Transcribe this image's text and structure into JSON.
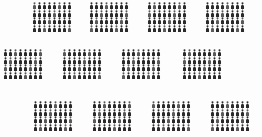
{
  "canvas": {
    "width": 262,
    "height": 137,
    "background": "#fdfdfd",
    "description": "Pictogram infographic of twelve blocks of small person-shaped figure icons"
  },
  "figure": {
    "icon_name": "person-figure-icon",
    "color": "#2b2b2b",
    "color_light": "#5a5a5a",
    "cell_width": 5,
    "cell_height": 7.6,
    "glyph_width": 3.4,
    "glyph_height": 6.6
  },
  "blocks": [
    {
      "id": "block-r1-c1",
      "row": 1,
      "col": 1,
      "x": 32,
      "y": 2,
      "cols": 8,
      "rows": 4,
      "count": 32,
      "row_counts": [
        8,
        8,
        8,
        8
      ]
    },
    {
      "id": "block-r1-c2",
      "row": 1,
      "col": 2,
      "x": 89,
      "y": 2,
      "cols": 8,
      "rows": 4,
      "count": 32,
      "row_counts": [
        8,
        8,
        8,
        8
      ]
    },
    {
      "id": "block-r1-c3",
      "row": 1,
      "col": 3,
      "x": 147,
      "y": 2,
      "cols": 8,
      "rows": 4,
      "count": 32,
      "row_counts": [
        8,
        8,
        8,
        8
      ]
    },
    {
      "id": "block-r1-c4",
      "row": 1,
      "col": 4,
      "x": 205,
      "y": 2,
      "cols": 8,
      "rows": 4,
      "count": 32,
      "row_counts": [
        8,
        8,
        8,
        8
      ]
    },
    {
      "id": "block-r2-c1",
      "row": 2,
      "col": 1,
      "x": 3,
      "y": 49,
      "cols": 8,
      "rows": 4,
      "count": 32,
      "row_counts": [
        8,
        8,
        8,
        8
      ]
    },
    {
      "id": "block-r2-c2",
      "row": 2,
      "col": 2,
      "x": 62,
      "y": 49,
      "cols": 8,
      "rows": 4,
      "count": 32,
      "row_counts": [
        8,
        8,
        8,
        8
      ]
    },
    {
      "id": "block-r2-c3",
      "row": 2,
      "col": 3,
      "x": 121,
      "y": 49,
      "cols": 8,
      "rows": 4,
      "count": 32,
      "row_counts": [
        8,
        8,
        8,
        8
      ]
    },
    {
      "id": "block-r2-c4",
      "row": 2,
      "col": 4,
      "x": 182,
      "y": 49,
      "cols": 8,
      "rows": 4,
      "count": 32,
      "row_counts": [
        8,
        8,
        8,
        8
      ]
    },
    {
      "id": "block-r3-c1",
      "row": 3,
      "col": 1,
      "x": 33,
      "y": 101,
      "cols": 8,
      "rows": 4,
      "count": 32,
      "row_counts": [
        8,
        8,
        8,
        8
      ]
    },
    {
      "id": "block-r3-c2",
      "row": 3,
      "col": 2,
      "x": 92,
      "y": 101,
      "cols": 8,
      "rows": 4,
      "count": 32,
      "row_counts": [
        8,
        8,
        8,
        8
      ]
    },
    {
      "id": "block-r3-c3",
      "row": 3,
      "col": 3,
      "x": 151,
      "y": 101,
      "cols": 8,
      "rows": 4,
      "count": 32,
      "row_counts": [
        8,
        8,
        8,
        8
      ]
    },
    {
      "id": "block-r3-c4",
      "row": 3,
      "col": 4,
      "x": 210,
      "y": 101,
      "cols": 8,
      "rows": 4,
      "count": 32,
      "row_counts": [
        8,
        8,
        8,
        8
      ]
    }
  ],
  "totals": {
    "block_count": 12,
    "figures_total": 384
  }
}
